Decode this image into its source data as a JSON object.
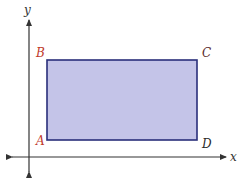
{
  "diagram": {
    "type": "coordinate-plane-rectangle",
    "axes": {
      "x_label": "x",
      "y_label": "y",
      "color": "#333333"
    },
    "rectangle": {
      "fill": "#c4c4e8",
      "stroke": "#2a2f7a",
      "vertices": {
        "A": "A",
        "B": "B",
        "C": "C",
        "D": "D"
      },
      "vertex_order": [
        "A",
        "B",
        "C",
        "D"
      ]
    },
    "label_colors": {
      "A": "#c0392b",
      "B": "#c0392b",
      "C": "#5a2a2a",
      "D": "#2a2a2a"
    }
  }
}
